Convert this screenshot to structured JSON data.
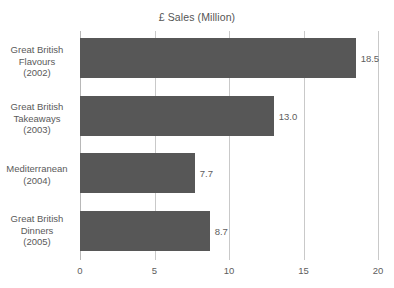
{
  "chart_data": {
    "type": "bar",
    "orientation": "horizontal",
    "title": "£ Sales (Million)",
    "xlabel": "",
    "ylabel": "",
    "categories": [
      "Great British Flavours (2002)",
      "Great British Takeaways (2003)",
      "Mediterranean (2004)",
      "Great British Dinners (2005)"
    ],
    "category_lines": [
      [
        "Great British",
        "Flavours",
        "(2002)"
      ],
      [
        "Great British",
        "Takeaways",
        "(2003)"
      ],
      [
        "Mediterranean",
        "(2004)"
      ],
      [
        "Great British",
        "Dinners",
        "(2005)"
      ]
    ],
    "values": [
      18.5,
      13.0,
      7.7,
      8.7
    ],
    "value_labels": [
      "18.5",
      "13.0",
      "7.7",
      "8.7"
    ],
    "xlim": [
      0,
      20
    ],
    "xticks": [
      0,
      5,
      10,
      15,
      20
    ],
    "xtick_labels": [
      "0",
      "5",
      "10",
      "15",
      "20"
    ],
    "grid": true,
    "grid_axis": "x",
    "legend": false,
    "bar_color": "#575757",
    "grid_color": "#c9c9c9",
    "text_color": "#5a5a5a",
    "background": "#ffffff"
  }
}
